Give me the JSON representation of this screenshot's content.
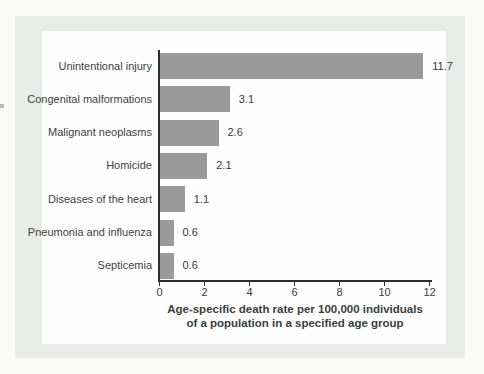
{
  "figure": {
    "kind": "textbook-bar-chart-figure",
    "frame_color": "#e8ebe8",
    "panel_color": "#fefefe",
    "bar_color": "#9a9a9a",
    "axis_color": "#2e2e2e",
    "text_color": "#3e3e3e"
  },
  "chart_data": {
    "type": "bar",
    "orientation": "horizontal",
    "title": "",
    "xlabel_line1": "Age-specific death rate per 100,000 individuals",
    "xlabel_line2": "of a population in a specified age group",
    "ylabel": "",
    "categories": [
      "Unintentional injury",
      "Congenital malformations",
      "Malignant neoplasms",
      "Homicide",
      "Diseases of the heart",
      "Pneumonia and influenza",
      "Septicemia"
    ],
    "values": [
      11.7,
      3.1,
      2.6,
      2.1,
      1.1,
      0.6,
      0.6
    ],
    "value_labels": [
      "11.7",
      "3.1",
      "2.6",
      "2.1",
      "1.1",
      "0.6",
      "0.6"
    ],
    "x_ticks": [
      0,
      2,
      4,
      6,
      8,
      10,
      12
    ],
    "xlim": [
      0,
      12
    ],
    "grid": false,
    "legend": "none"
  }
}
